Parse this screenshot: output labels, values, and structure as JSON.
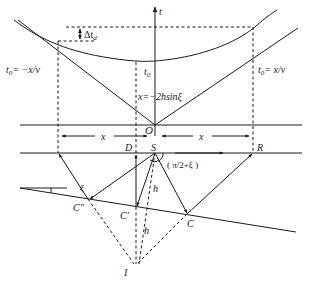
{
  "figure": {
    "type": "seismic reflection geometry diagram (dipping reflector, time-distance curve)",
    "colors": {
      "line": "#1a1a1a",
      "background": "#ffffff"
    }
  },
  "labels": {
    "t_axis": "t",
    "delta_t": "Δt",
    "delta_t_sub": "d",
    "t0_left_main": "t",
    "t0_left_sub": "0",
    "t0_left_rest": "= −x/v",
    "t0_right_main": "t",
    "t0_right_sub": "0",
    "t0_right_rest": "= x/v",
    "t0_center_main": "t",
    "t0_center_sub": "0",
    "min_offset": "x=−2h",
    "min_offset_sin": "sinξ",
    "origin": "O",
    "x_left": "x",
    "x_right": "x",
    "point_D": "D",
    "point_S": "S",
    "point_R": "R",
    "angle": "( π/2+ξ )",
    "dip_angle": "ξ",
    "point_C2": "C″",
    "point_C1": "C′",
    "point_C": "C",
    "h_upper": "h",
    "h_lower": "h",
    "image_point": "I"
  }
}
